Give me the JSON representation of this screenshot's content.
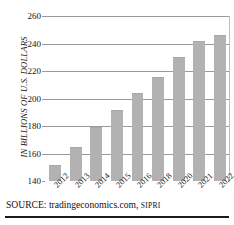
{
  "chart_data": {
    "type": "bar",
    "title": "",
    "xlabel": "",
    "ylabel": "IN BILLIONS OF U.S. DOLLARS",
    "categories": [
      "2012",
      "2013",
      "2014",
      "2015",
      "2016",
      "2018",
      "2020",
      "2021",
      "2022"
    ],
    "values": [
      152,
      165,
      179,
      192,
      204,
      216,
      230,
      242,
      246
    ],
    "ylim": [
      140,
      260
    ],
    "yticks": [
      260,
      240,
      220,
      200,
      180,
      160,
      140
    ],
    "grid": true,
    "legend": null,
    "bar_color": "#b2b2b2",
    "gridline_color": "#9a9a9a"
  },
  "source": {
    "prefix": "SOURCE: tradingeconomics.com,",
    "agency": "SIPRI"
  }
}
